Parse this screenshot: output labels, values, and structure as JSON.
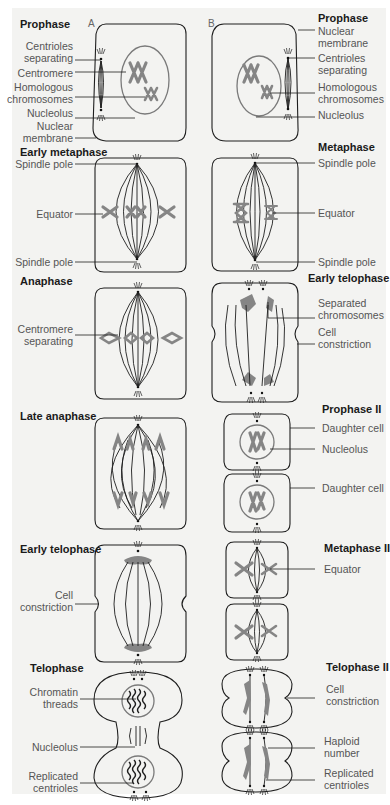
{
  "figure": {
    "column_labels": {
      "A": "A",
      "B": "B"
    },
    "colors": {
      "background": "#f3f3f1",
      "line": "#1e1e1e",
      "chromosome": "#858585",
      "label_text": "#555555",
      "title_text": "#1a1a1a"
    }
  },
  "column_a": {
    "title": "Mitosis stages (column A)",
    "stages": [
      {
        "name": "Prophase",
        "labels": [
          "Centrioles separating",
          "Centromere",
          "Homologous chromosomes",
          "Nucleolus",
          "Nuclear membrane"
        ]
      },
      {
        "name": "Early metaphase",
        "labels": [
          "Spindle pole",
          "Equator",
          "Spindle pole"
        ]
      },
      {
        "name": "Anaphase",
        "labels": [
          "Centromere separating"
        ]
      },
      {
        "name": "Late anaphase",
        "labels": []
      },
      {
        "name": "Early telophase",
        "labels": [
          "Cell constriction"
        ]
      },
      {
        "name": "Telophase",
        "labels": [
          "Chromatin threads",
          "Nucleolus",
          "Replicated centrioles"
        ]
      }
    ]
  },
  "column_b": {
    "title": "Meiosis stages (column B)",
    "stages": [
      {
        "name": "Prophase",
        "labels": [
          "Nuclear membrane",
          "Centrioles separating",
          "Homologous chromosomes",
          "Nucleolus"
        ]
      },
      {
        "name": "Metaphase",
        "labels": [
          "Spindle pole",
          "Equator",
          "Spindle pole"
        ]
      },
      {
        "name": "Early telophase",
        "labels": [
          "Separated chromosomes",
          "Cell constriction"
        ]
      },
      {
        "name": "Prophase II",
        "labels": [
          "Daughter cell",
          "Nucleolus",
          "Daughter cell"
        ]
      },
      {
        "name": "Metaphase II",
        "labels": [
          "Equator"
        ]
      },
      {
        "name": "Telophase II",
        "labels": [
          "Cell constriction",
          "Haploid number",
          "Replicated centrioles"
        ]
      }
    ]
  },
  "text": {
    "a_prophase": "Prophase",
    "a_centrioles": [
      "Centrioles",
      "separating"
    ],
    "a_centromere": "Centromere",
    "a_homologous": [
      "Homologous",
      "chromosomes"
    ],
    "a_nucleolus": "Nucleolus",
    "a_nuclear": [
      "Nuclear",
      "membrane"
    ],
    "a_early_metaphase": "Early metaphase",
    "a_spindle_pole_top": "Spindle pole",
    "a_equator": "Equator",
    "a_spindle_pole_bottom": "Spindle pole",
    "a_anaphase": "Anaphase",
    "a_centromere_sep": [
      "Centromere",
      "separating"
    ],
    "a_late_anaphase": "Late anaphase",
    "a_early_telophase": "Early telophase",
    "a_cell_constriction": [
      "Cell",
      "constriction"
    ],
    "a_telophase": "Telophase",
    "a_chromatin": [
      "Chromatin",
      "threads"
    ],
    "a_nucleolus2": "Nucleolus",
    "a_replicated": [
      "Replicated",
      "centrioles"
    ],
    "b_prophase": "Prophase",
    "b_nuclear": [
      "Nuclear",
      "membrane"
    ],
    "b_centrioles": [
      "Centrioles",
      "separating"
    ],
    "b_homologous": [
      "Homologous",
      "chromosomes"
    ],
    "b_nucleolus": "Nucleolus",
    "b_metaphase": "Metaphase",
    "b_spindle_pole_top": "Spindle pole",
    "b_equator": "Equator",
    "b_spindle_pole_bottom": "Spindle pole",
    "b_early_telophase": "Early telophase",
    "b_separated": [
      "Separated",
      "chromosomes"
    ],
    "b_cell_constriction": [
      "Cell",
      "constriction"
    ],
    "b_prophase2": "Prophase II",
    "b_daughter1": "Daughter cell",
    "b_nucleolus2": "Nucleolus",
    "b_daughter2": "Daughter cell",
    "b_metaphase2": "Metaphase II",
    "b_equator2": "Equator",
    "b_telophase2": "Telophase II",
    "b_cell_constriction2": [
      "Cell",
      "constriction"
    ],
    "b_haploid": [
      "Haploid",
      "number"
    ],
    "b_replicated": [
      "Replicated",
      "centrioles"
    ]
  }
}
